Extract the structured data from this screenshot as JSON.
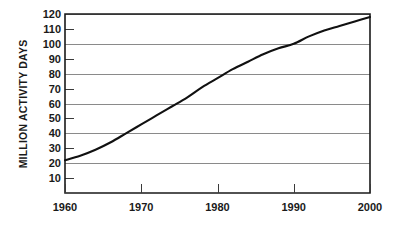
{
  "chart_data": {
    "type": "line",
    "title": "",
    "xlabel": "",
    "ylabel": "MILLION ACTIVITY DAYS",
    "xlim": [
      1960,
      2000
    ],
    "ylim": [
      0,
      120
    ],
    "grid": "horizontal major gridlines every 20 units; minor tick stubs at odd tens",
    "legend": "none",
    "x_ticks": [
      1960,
      1970,
      1980,
      1990,
      2000
    ],
    "x_tick_labels": [
      "1960",
      "1970",
      "1980",
      "1990",
      "2000"
    ],
    "y_ticks": [
      10,
      20,
      30,
      40,
      50,
      60,
      70,
      80,
      90,
      100,
      110,
      120
    ],
    "y_tick_labels": [
      "10",
      "20",
      "30",
      "40",
      "50",
      "60",
      "70",
      "80",
      "90",
      "100",
      "110",
      "120"
    ],
    "y_major_gridlines": [
      20,
      40,
      60,
      80,
      100,
      120
    ],
    "y_minor_ticks": [
      10,
      30,
      50,
      70,
      90,
      110
    ],
    "series": [
      {
        "name": "Million Activity Days",
        "x": [
          1960,
          1962,
          1964,
          1966,
          1968,
          1970,
          1972,
          1974,
          1976,
          1978,
          1980,
          1982,
          1984,
          1986,
          1988,
          1990,
          1992,
          1994,
          1996,
          1998,
          2000
        ],
        "values": [
          22,
          25,
          29,
          34,
          40,
          46,
          52,
          58,
          64,
          71,
          77,
          83,
          88,
          93,
          97,
          100,
          105,
          109,
          112,
          115,
          118
        ]
      }
    ],
    "annotations": [
      "Curve begins near 22 million activity days at 1960",
      "Curve passes through 100 million activity days at 1990",
      "Curve ends near 118 million activity days at 2000"
    ]
  },
  "axis": {
    "y_title": "MILLION ACTIVITY DAYS"
  }
}
